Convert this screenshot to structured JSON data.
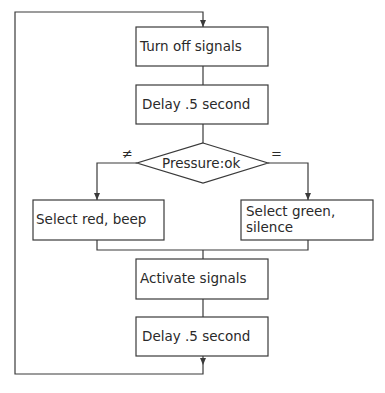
{
  "diagram": {
    "type": "flowchart",
    "nodes": {
      "turn_off": "Turn off signals",
      "delay1": "Delay .5 second",
      "decision": "Pressure:ok",
      "select_red_1": "Select red, beep",
      "select_green_1": "Select green,",
      "select_green_2": "silence",
      "activate": "Activate signals",
      "delay2": "Delay .5 second"
    },
    "branch_labels": {
      "not_equal": "≠",
      "equal": "="
    },
    "edges": [
      {
        "from": "loop-start",
        "to": "turn_off"
      },
      {
        "from": "turn_off",
        "to": "delay1"
      },
      {
        "from": "delay1",
        "to": "decision"
      },
      {
        "from": "decision",
        "to": "select_red",
        "label": "≠"
      },
      {
        "from": "decision",
        "to": "select_green",
        "label": "="
      },
      {
        "from": "select_red",
        "to": "activate"
      },
      {
        "from": "select_green",
        "to": "activate"
      },
      {
        "from": "activate",
        "to": "delay2"
      },
      {
        "from": "delay2",
        "to": "loop-start"
      }
    ]
  }
}
